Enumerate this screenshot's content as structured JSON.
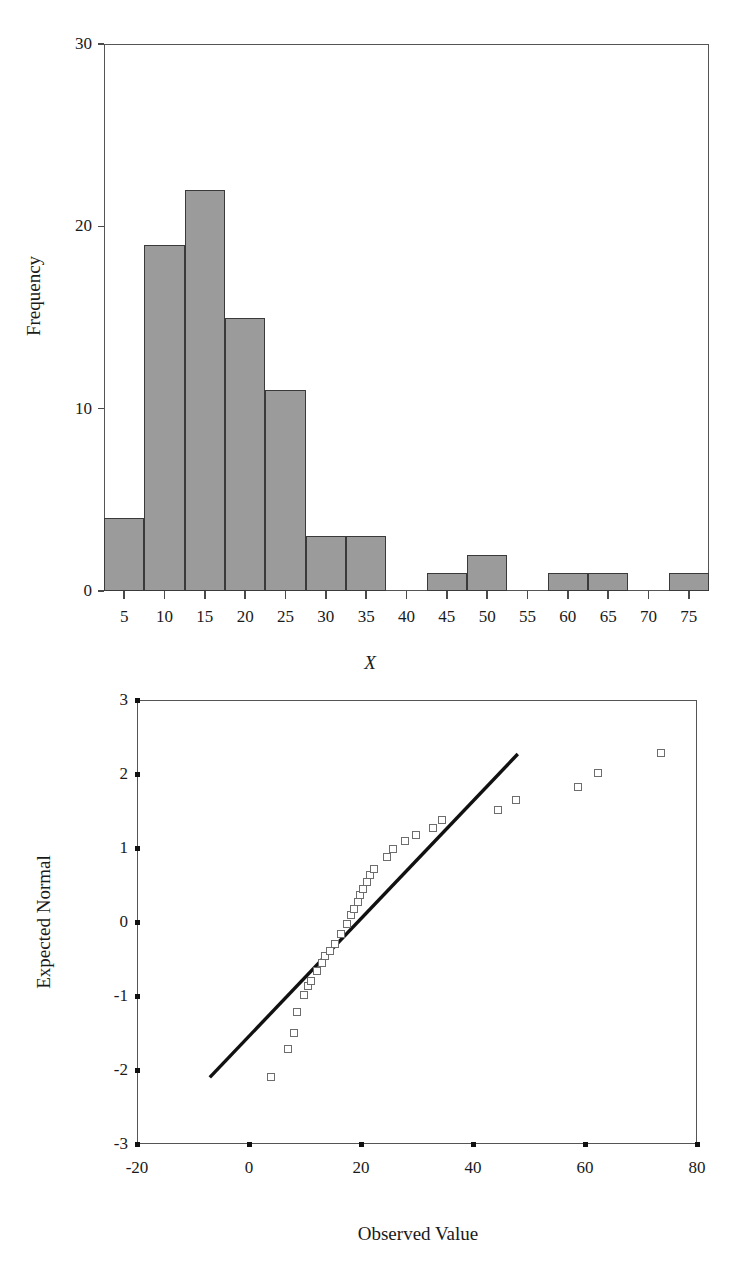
{
  "figure": {
    "panels": [
      "histogram",
      "normal-qq-plot"
    ]
  },
  "chart_data": [
    {
      "type": "bar",
      "id": "histogram",
      "title": "",
      "xlabel": "X",
      "ylabel": "Frequency",
      "xlim": [
        2.5,
        77.5
      ],
      "ylim": [
        0,
        30
      ],
      "xticks": [
        5,
        10,
        15,
        20,
        25,
        30,
        35,
        40,
        45,
        50,
        55,
        60,
        65,
        70,
        75
      ],
      "xtick_labels": [
        "5",
        "10",
        "15",
        "20",
        "25",
        "30",
        "35",
        "40",
        "45",
        "50",
        "55",
        "60",
        "65",
        "70",
        "75"
      ],
      "yticks": [
        0,
        10,
        20,
        30
      ],
      "ytick_labels": [
        "0",
        "10",
        "20",
        "30"
      ],
      "bin_width": 5,
      "grid": false,
      "bar_fill": "#9b9b9b",
      "bar_edge": "#3a3a3a",
      "categories": [
        5,
        10,
        15,
        20,
        25,
        30,
        35,
        40,
        45,
        50,
        55,
        60,
        65,
        70,
        75
      ],
      "values": [
        4,
        19,
        22,
        15,
        11,
        3,
        3,
        0,
        1,
        2,
        0,
        1,
        1,
        0,
        1
      ]
    },
    {
      "type": "scatter",
      "id": "normal-qq-plot",
      "title": "",
      "xlabel": "Observed Value",
      "ylabel": "Expected Normal",
      "xlim": [
        -20,
        80
      ],
      "ylim": [
        -3,
        3
      ],
      "xticks": [
        -20,
        0,
        20,
        40,
        60,
        80
      ],
      "xtick_labels": [
        "-20",
        "0",
        "20",
        "40",
        "60",
        "80"
      ],
      "yticks": [
        3,
        2,
        1,
        0,
        -1,
        -2,
        -3
      ],
      "ytick_labels": [
        "3",
        "2",
        "1",
        "0",
        "-1",
        "-2",
        "-3"
      ],
      "grid": false,
      "marker": "open-square",
      "marker_edge": "#6d6d6d",
      "reference_line": {
        "label": "normal reference line",
        "color": "#111111",
        "x": [
          -7.0,
          48.0
        ],
        "y": [
          -2.1,
          2.27
        ]
      },
      "points": [
        {
          "x": 4.0,
          "y": -2.1
        },
        {
          "x": 7.0,
          "y": -1.72
        },
        {
          "x": 8.0,
          "y": -1.5
        },
        {
          "x": 8.5,
          "y": -1.21
        },
        {
          "x": 9.8,
          "y": -0.98
        },
        {
          "x": 10.5,
          "y": -0.86
        },
        {
          "x": 11.0,
          "y": -0.8
        },
        {
          "x": 12.2,
          "y": -0.66
        },
        {
          "x": 13.0,
          "y": -0.56
        },
        {
          "x": 13.6,
          "y": -0.46
        },
        {
          "x": 14.4,
          "y": -0.39
        },
        {
          "x": 15.4,
          "y": -0.3
        },
        {
          "x": 16.4,
          "y": -0.16
        },
        {
          "x": 17.5,
          "y": -0.03
        },
        {
          "x": 18.2,
          "y": 0.09
        },
        {
          "x": 18.8,
          "y": 0.18
        },
        {
          "x": 19.4,
          "y": 0.27
        },
        {
          "x": 19.8,
          "y": 0.36
        },
        {
          "x": 20.4,
          "y": 0.45
        },
        {
          "x": 21.0,
          "y": 0.54
        },
        {
          "x": 21.6,
          "y": 0.63
        },
        {
          "x": 22.4,
          "y": 0.72
        },
        {
          "x": 24.6,
          "y": 0.88
        },
        {
          "x": 25.8,
          "y": 0.99
        },
        {
          "x": 27.8,
          "y": 1.09
        },
        {
          "x": 29.8,
          "y": 1.17
        },
        {
          "x": 32.8,
          "y": 1.27
        },
        {
          "x": 34.4,
          "y": 1.38
        },
        {
          "x": 44.4,
          "y": 1.52
        },
        {
          "x": 47.6,
          "y": 1.65
        },
        {
          "x": 58.8,
          "y": 1.83
        },
        {
          "x": 62.4,
          "y": 2.01
        },
        {
          "x": 73.6,
          "y": 2.29
        }
      ]
    }
  ],
  "histogram": {
    "ylabel": "Frequency",
    "xlabel": "X",
    "ytick_labels": [
      "30",
      "20",
      "10",
      "0"
    ],
    "xtick_labels": [
      "5",
      "10",
      "15",
      "20",
      "25",
      "30",
      "35",
      "40",
      "45",
      "50",
      "55",
      "60",
      "65",
      "70",
      "75"
    ]
  },
  "qq": {
    "ylabel": "Expected Normal",
    "xlabel": "Observed Value",
    "ytick_labels": [
      "3",
      "2",
      "1",
      "0",
      "-1",
      "-2",
      "-3"
    ],
    "xtick_labels": [
      "-20",
      "0",
      "20",
      "40",
      "60",
      "80"
    ]
  }
}
